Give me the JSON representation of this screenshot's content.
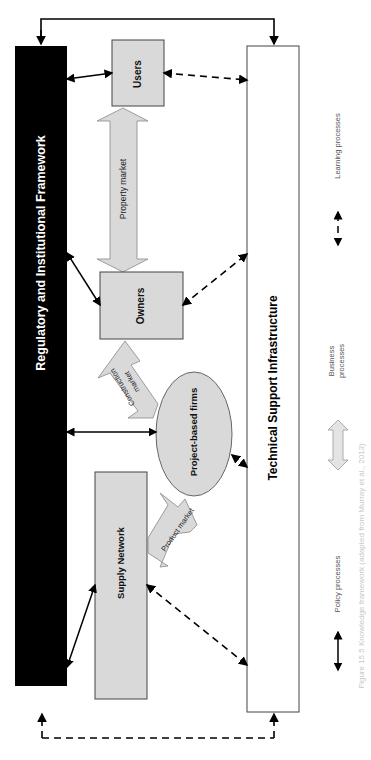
{
  "diagram": {
    "nodes": {
      "regulatory": {
        "label": "Regulatory and Institutional Framework",
        "fill": "#000000",
        "text_color": "#ffffff"
      },
      "technical": {
        "label": "Technical Support Infrastructure",
        "fill": "#ffffff"
      },
      "users": {
        "label": "Users",
        "fill": "#d9d9d9"
      },
      "owners": {
        "label": "Owners",
        "fill": "#d9d9d9"
      },
      "project_firms": {
        "label": "Project-based firms",
        "fill": "#d9d9d9"
      },
      "supply_network": {
        "label": "Supply Network",
        "fill": "#d9d9d9"
      }
    },
    "market_arrows": {
      "property": {
        "label": "Property market"
      },
      "construction": {
        "label_line1": "Construction",
        "label_line2": "market"
      },
      "product": {
        "label": "Product market"
      }
    },
    "legend": {
      "learning": {
        "label": "Learning processes",
        "style": "dashed"
      },
      "business": {
        "label_line1": "Business",
        "label_line2": "processes",
        "style": "block-arrow"
      },
      "policy": {
        "label": "Policy processes",
        "style": "solid"
      }
    },
    "caption": "Figure 15.5 Knowledge framework (adapted from Murray et al., 2013)"
  }
}
